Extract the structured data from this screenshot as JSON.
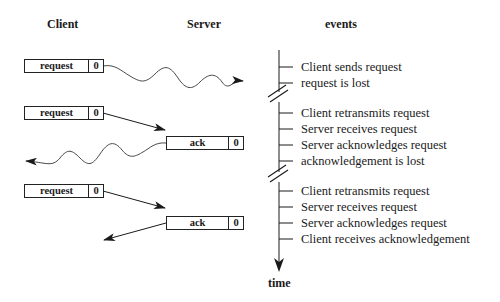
{
  "headers": {
    "client": "Client",
    "server": "Server",
    "events": "events"
  },
  "messages": [
    {
      "label": "request",
      "seq": "0",
      "from": "client",
      "style": "wavy",
      "delivered": false
    },
    {
      "label": "request",
      "seq": "0",
      "from": "client",
      "style": "straight",
      "delivered": true
    },
    {
      "label": "ack",
      "seq": "0",
      "from": "server",
      "style": "wavy",
      "delivered": false
    },
    {
      "label": "request",
      "seq": "0",
      "from": "client",
      "style": "straight",
      "delivered": true
    },
    {
      "label": "ack",
      "seq": "0",
      "from": "server",
      "style": "straight",
      "delivered": true
    }
  ],
  "events": [
    "Client sends request",
    "request is lost",
    "Client retransmits request",
    "Server receives request",
    "Server acknowledges request",
    "acknowledgement is lost",
    "Client retransmits request",
    "Server receives request",
    "Server acknowledges request",
    "Client receives acknowledgement"
  ],
  "timeline": {
    "axis_label": "time"
  },
  "colors": {
    "ink": "#1a1a1a",
    "background": "#ffffff"
  }
}
